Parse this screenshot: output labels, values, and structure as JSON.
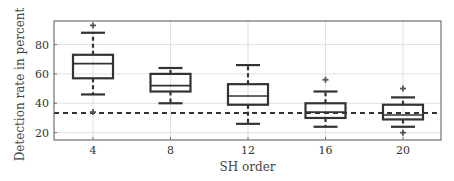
{
  "chart_data": {
    "type": "box",
    "title": "",
    "xlabel": "SH order",
    "ylabel": "Detection rate in percent",
    "categories": [
      "4",
      "8",
      "12",
      "16",
      "20"
    ],
    "ylim": [
      15,
      96
    ],
    "yticks": [
      20,
      40,
      60,
      80
    ],
    "grid": true,
    "reference_line": {
      "value": 33.3,
      "style": "dashed",
      "color": "#333333"
    },
    "series": [
      {
        "category": "4",
        "whisker_low": 46,
        "q1": 57,
        "median": 67,
        "q3": 73,
        "whisker_high": 88,
        "outliers": [
          93,
          34
        ]
      },
      {
        "category": "8",
        "whisker_low": 40,
        "q1": 48,
        "median": 52,
        "q3": 60,
        "whisker_high": 64,
        "outliers": []
      },
      {
        "category": "12",
        "whisker_low": 26,
        "q1": 39,
        "median": 45,
        "q3": 53,
        "whisker_high": 66,
        "outliers": []
      },
      {
        "category": "16",
        "whisker_low": 24,
        "q1": 30,
        "median": 34,
        "q3": 40,
        "whisker_high": 48,
        "outliers": [
          56
        ]
      },
      {
        "category": "20",
        "whisker_low": 24,
        "q1": 29,
        "median": 32,
        "q3": 39,
        "whisker_high": 44,
        "outliers": [
          50,
          20
        ]
      }
    ]
  },
  "colors": {
    "box": "#333333",
    "grid": "#d9d9d9",
    "axis": "#555555",
    "text": "#333333"
  }
}
